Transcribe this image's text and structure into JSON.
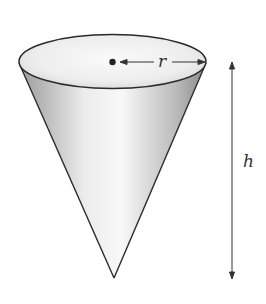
{
  "diagram": {
    "labels": {
      "radius": "r",
      "height": "h"
    },
    "colors": {
      "stroke": "#2a2a2a",
      "shade_dark": "#8c8c8c",
      "shade_light": "#f4f4f4",
      "background": "#ffffff"
    }
  }
}
